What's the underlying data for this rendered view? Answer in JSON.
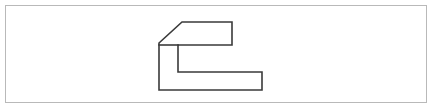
{
  "canvas": {
    "width": 433,
    "height": 110,
    "background_color": "#ffffff"
  },
  "border_frame": {
    "name": "outer-border",
    "x": 5.5,
    "y": 5.5,
    "width": 421,
    "height": 97,
    "stroke_color": "#b9b9b9",
    "stroke_width": 1,
    "fill": "none"
  },
  "figure": {
    "name": "block-shape-outline",
    "stroke_color": "#3a3a3a",
    "stroke_width": 1.6,
    "fill": "none",
    "outline_points": "159,43 182,22 232,22 232,45 178,45 178,72 262,72 262,90 159,90",
    "interior_lines": [
      {
        "name": "top-block-divider",
        "x1": 159,
        "y1": 45,
        "x2": 178,
        "y2": 45
      }
    ],
    "vertices": [
      {
        "label": "chamfer-bottom",
        "x": 159,
        "y": 43
      },
      {
        "label": "chamfer-top",
        "x": 182,
        "y": 22
      },
      {
        "label": "top-right",
        "x": 232,
        "y": 22
      },
      {
        "label": "upper-arm-bottom-right",
        "x": 232,
        "y": 45
      },
      {
        "label": "notch-top-left",
        "x": 178,
        "y": 45
      },
      {
        "label": "notch-bottom-left",
        "x": 178,
        "y": 72
      },
      {
        "label": "lower-arm-top-right",
        "x": 262,
        "y": 72
      },
      {
        "label": "lower-arm-bottom-right",
        "x": 262,
        "y": 90
      },
      {
        "label": "bottom-left",
        "x": 159,
        "y": 90
      }
    ]
  }
}
